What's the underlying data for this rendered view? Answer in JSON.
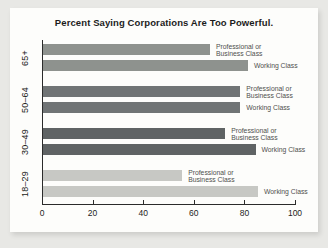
{
  "page": {
    "background": "#e8e8e5",
    "panel_background": "#fdfdfb"
  },
  "chart_data": {
    "type": "bar",
    "orientation": "horizontal",
    "title": "Percent Saying Corporations Are Too Powerful.",
    "categories": [
      "65+",
      "50–64",
      "30–49",
      "18–29"
    ],
    "series": [
      {
        "name": "Professional or Business Class",
        "label_lines": [
          "Professional or",
          "Business Class"
        ],
        "values": [
          66,
          78,
          72,
          55
        ]
      },
      {
        "name": "Working Class",
        "label_lines": [
          "Working Class"
        ],
        "values": [
          81,
          78,
          84,
          85
        ]
      }
    ],
    "group_colors": [
      "#8e928e",
      "#707475",
      "#5f6364",
      "#c7c8c4"
    ],
    "xlim": [
      0,
      100
    ],
    "x_ticks": [
      0,
      20,
      40,
      60,
      80,
      100
    ],
    "axis_color": "#2b2b2b",
    "label_color": "#4f4f4d",
    "grid": false,
    "legend": "inline-labels-right-of-bars"
  }
}
